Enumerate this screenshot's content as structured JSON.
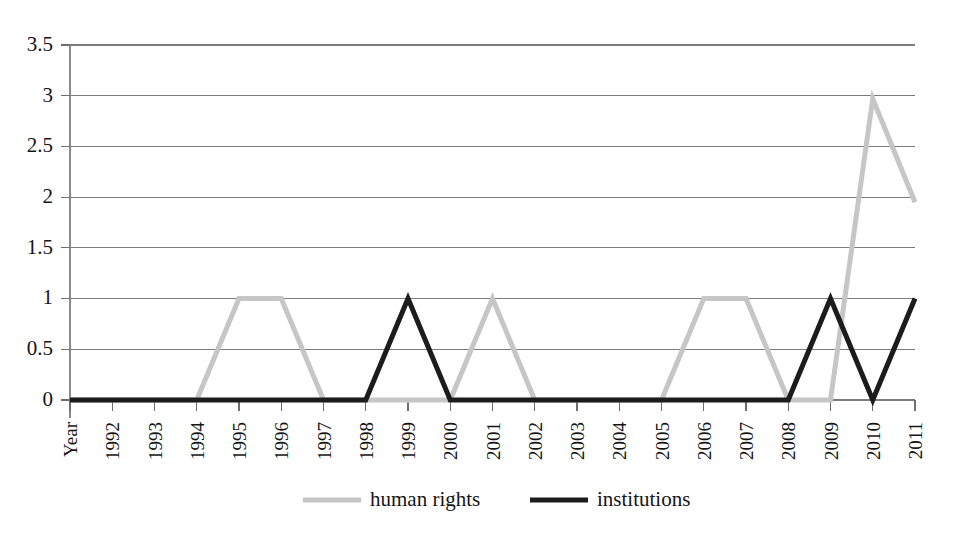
{
  "chart_data": {
    "type": "line",
    "title": "",
    "subtitle": "",
    "xlabel": "",
    "ylabel": "",
    "ylim": [
      0,
      3.5
    ],
    "y_ticks": [
      "0",
      "0.5",
      "1",
      "1.5",
      "2",
      "2.5",
      "3",
      "3.5"
    ],
    "y_tick_values": [
      0,
      0.5,
      1,
      1.5,
      2,
      2.5,
      3,
      3.5
    ],
    "grid": true,
    "legend_position": "bottom",
    "categories": [
      "Year",
      "1992",
      "1993",
      "1994",
      "1995",
      "1996",
      "1997",
      "1998",
      "1999",
      "2000",
      "2001",
      "2002",
      "2003",
      "2004",
      "2005",
      "2006",
      "2007",
      "2008",
      "2009",
      "2010",
      "2011"
    ],
    "series": [
      {
        "name": "human rights",
        "color": "#c6c6c6",
        "stroke_width": 5,
        "values": [
          0,
          0,
          0,
          0,
          1,
          1,
          0,
          0,
          0,
          0,
          1,
          0,
          0,
          0,
          0,
          1,
          1,
          0,
          0,
          2.97,
          1.95
        ]
      },
      {
        "name": "institutions",
        "color": "#1c1c1c",
        "stroke_width": 5,
        "values": [
          0,
          0,
          0,
          0,
          0,
          0,
          0,
          0,
          1,
          0,
          0,
          0,
          0,
          0,
          0,
          0,
          0,
          0,
          1,
          0,
          1
        ]
      }
    ]
  },
  "legend": {
    "items": [
      {
        "label": "human rights",
        "color": "#c6c6c6"
      },
      {
        "label": "institutions",
        "color": "#1c1c1c"
      }
    ]
  },
  "layout": {
    "plot_left": 70,
    "plot_right": 915,
    "plot_top": 45,
    "plot_bottom": 400,
    "legend_y": 500,
    "legend_swatch1_x": 303,
    "legend_label1_x": 370,
    "legend_swatch2_x": 530,
    "legend_label2_x": 597
  }
}
